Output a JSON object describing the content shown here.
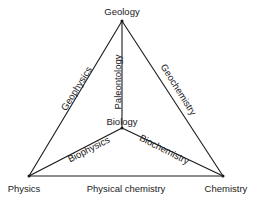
{
  "diagram": {
    "type": "tetrahedron-of-sciences",
    "nodes": [
      {
        "id": "geology",
        "label": "Geology",
        "x": 122,
        "y": 21,
        "label_x": 122,
        "label_y": 12
      },
      {
        "id": "biology",
        "label": "Biology",
        "x": 122,
        "y": 128,
        "label_x": 122,
        "label_y": 122
      },
      {
        "id": "physics",
        "label": "Physics",
        "x": 29,
        "y": 176,
        "label_x": 24,
        "label_y": 189
      },
      {
        "id": "chemistry",
        "label": "Chemistry",
        "x": 223,
        "y": 176,
        "label_x": 226,
        "label_y": 189
      }
    ],
    "edges": [
      {
        "from": "geology",
        "to": "physics",
        "label": "Geophysics",
        "lx": 77,
        "ly": 89,
        "angle": -58
      },
      {
        "from": "geology",
        "to": "biology",
        "label": "Paleontology",
        "lx": 118,
        "ly": 82,
        "angle": -90
      },
      {
        "from": "geology",
        "to": "chemistry",
        "label": "Geochemistry",
        "lx": 178,
        "ly": 90,
        "angle": 58
      },
      {
        "from": "biology",
        "to": "physics",
        "label": "Biophysics",
        "lx": 89,
        "ly": 150,
        "angle": -27
      },
      {
        "from": "biology",
        "to": "chemistry",
        "label": "Biochemistry",
        "lx": 164,
        "ly": 150,
        "angle": 27
      },
      {
        "from": "physics",
        "to": "chemistry",
        "label": "Physical  chemistry",
        "lx": 126,
        "ly": 189,
        "angle": 0
      }
    ],
    "line_color": "#1a1a1a"
  }
}
